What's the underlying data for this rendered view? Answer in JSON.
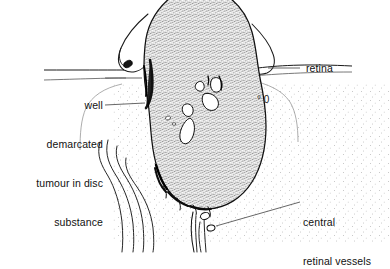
{
  "figure": {
    "kind": "medical-line-illustration",
    "background_color": "#ffffff",
    "ink_color": "#111111",
    "stipple_color": "#333333",
    "vitreous_tint": "#f2f2f2"
  },
  "labels": {
    "left": {
      "name": "tumour-label",
      "line1": "well",
      "line2": "demarcated",
      "line3": "tumour in disc",
      "line4": "substance"
    },
    "retina": {
      "name": "retina-label",
      "text": "retina"
    },
    "vessels": {
      "name": "central-retinal-vessels-label",
      "line1": "central",
      "line2": "retinal vessels"
    }
  },
  "markings": {
    "vitreous_mark": "° 0"
  }
}
